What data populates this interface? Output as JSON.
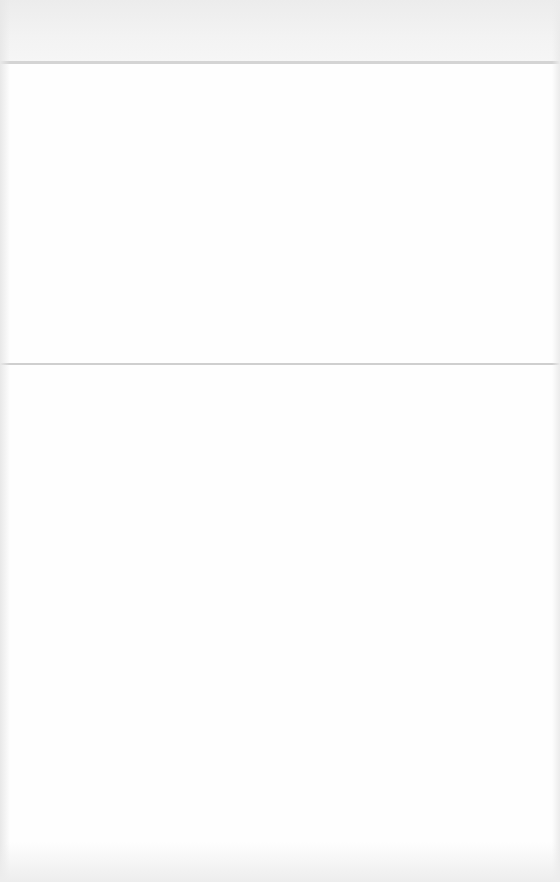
{
  "header": {
    "title": ""
  },
  "upper_panel": {
    "items": []
  },
  "lower_panel": {
    "items": []
  },
  "colors": {
    "background": "#fdfdfd",
    "header_band": "#f0f0f0",
    "divider": "#d4d4d4"
  }
}
